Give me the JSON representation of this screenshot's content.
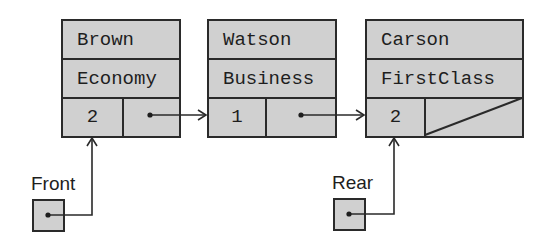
{
  "diagram": {
    "type": "linked-queue",
    "nodes": [
      {
        "name": "Brown",
        "class": "Economy",
        "count": "2",
        "next": "Watson"
      },
      {
        "name": "Watson",
        "class": "Business",
        "count": "1",
        "next": "Carson"
      },
      {
        "name": "Carson",
        "class": "FirstClass",
        "count": "2",
        "next": null
      }
    ],
    "pointers": [
      {
        "label": "Front",
        "target": "Brown"
      },
      {
        "label": "Rear",
        "target": "Carson"
      }
    ],
    "colors": {
      "fill": "#d0d0d0",
      "stroke": "#2a2a2a"
    }
  }
}
